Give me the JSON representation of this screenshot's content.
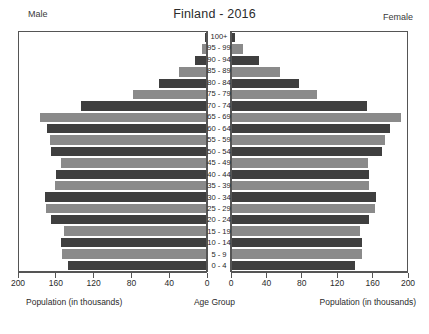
{
  "header": {
    "male_label": "Male",
    "female_label": "Female",
    "title": "Finland - 2016"
  },
  "axes": {
    "left_title": "Population (in thousands)",
    "center_title": "Age Group",
    "right_title": "Population (in thousands)",
    "left_ticks": [
      "200",
      "160",
      "120",
      "80",
      "40",
      "0"
    ],
    "right_ticks": [
      "0",
      "40",
      "80",
      "120",
      "160",
      "200"
    ]
  },
  "colors": {
    "bar_light": "#8a8a8a",
    "bar_dark": "#3f3f3f",
    "axis": "#555555",
    "background": "#ffffff"
  },
  "chart_data": {
    "type": "bar",
    "title": "Finland - 2016",
    "subtitle": "",
    "orientation": "population-pyramid",
    "xlabel": "Population (in thousands)",
    "ylabel": "Age Group",
    "xlim": [
      0,
      200
    ],
    "grid": false,
    "legend": [
      "Male",
      "Female"
    ],
    "legend_position": "top-corners",
    "categories": [
      "100+",
      "95 - 99",
      "90 - 94",
      "85 - 89",
      "80 - 84",
      "75 - 79",
      "70 - 74",
      "65 - 69",
      "60 - 64",
      "55 - 59",
      "50 - 54",
      "45 - 49",
      "40 - 44",
      "35 - 39",
      "30 - 34",
      "25 - 29",
      "20 - 24",
      "15 - 19",
      "10 - 14",
      "5 - 9",
      "0 - 4"
    ],
    "series": [
      {
        "name": "Male",
        "side": "left",
        "values": [
          1,
          4,
          12,
          29,
          50,
          78,
          134,
          178,
          170,
          167,
          166,
          155,
          160,
          162,
          172,
          171,
          166,
          152,
          155,
          154,
          148
        ]
      },
      {
        "name": "Female",
        "side": "right",
        "values": [
          3,
          13,
          31,
          55,
          76,
          97,
          154,
          193,
          180,
          175,
          171,
          155,
          157,
          157,
          164,
          163,
          157,
          146,
          148,
          148,
          141
        ]
      }
    ]
  }
}
